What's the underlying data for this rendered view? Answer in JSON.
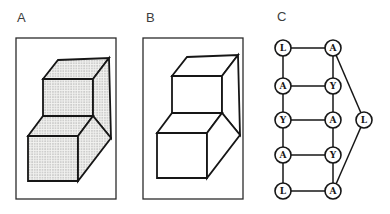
{
  "panels": {
    "a": {
      "label": "A",
      "label_pos": {
        "left": 17,
        "top": 11
      },
      "frame": {
        "x": 16,
        "y": 38,
        "w": 100,
        "h": 161
      },
      "shaded": true
    },
    "b": {
      "label": "B",
      "label_pos": {
        "left": 146,
        "top": 11
      },
      "frame": {
        "x": 143,
        "y": 38,
        "w": 100,
        "h": 161
      },
      "shaded": false
    },
    "c": {
      "label": "C",
      "label_pos": {
        "left": 277,
        "top": 10
      }
    }
  },
  "staircase": {
    "vertices": {
      "p1": [
        187,
        57
      ],
      "p2": [
        238,
        55
      ],
      "p3": [
        172,
        76
      ],
      "p4": [
        222,
        76
      ],
      "p5": [
        172,
        113
      ],
      "p6": [
        222,
        113
      ],
      "p7": [
        157,
        133
      ],
      "p8": [
        207,
        133
      ],
      "p9": [
        157,
        178
      ],
      "p10": [
        207,
        178
      ],
      "p11": [
        240,
        135
      ]
    },
    "faces": [
      {
        "name": "top-face",
        "points": [
          "p3",
          "p1",
          "p2",
          "p4"
        ]
      },
      {
        "name": "upper-front-face",
        "points": [
          "p3",
          "p4",
          "p6",
          "p5"
        ]
      },
      {
        "name": "upper-right-face",
        "points": [
          "p4",
          "p2",
          "p11",
          "p6"
        ]
      },
      {
        "name": "step-tread-face",
        "points": [
          "p7",
          "p5",
          "p6",
          "p8"
        ]
      },
      {
        "name": "lower-front-face",
        "points": [
          "p7",
          "p8",
          "p10",
          "p9"
        ]
      },
      {
        "name": "lower-right-face",
        "points": [
          "p8",
          "p6",
          "p11",
          "p10"
        ]
      }
    ],
    "panel_a_offset": [
      -129,
      3
    ],
    "panel_b_offset": [
      0,
      0
    ]
  },
  "graph": {
    "node_radius": 8,
    "nodes": [
      {
        "id": "l1",
        "x": 283,
        "y": 48,
        "label": "L"
      },
      {
        "id": "l2",
        "x": 283,
        "y": 86,
        "label": "A"
      },
      {
        "id": "l3",
        "x": 283,
        "y": 120,
        "label": "Y"
      },
      {
        "id": "l4",
        "x": 283,
        "y": 155,
        "label": "A"
      },
      {
        "id": "l5",
        "x": 283,
        "y": 191,
        "label": "L"
      },
      {
        "id": "r1",
        "x": 333,
        "y": 48,
        "label": "A"
      },
      {
        "id": "r2",
        "x": 333,
        "y": 86,
        "label": "Y"
      },
      {
        "id": "r3",
        "x": 333,
        "y": 120,
        "label": "A"
      },
      {
        "id": "r4",
        "x": 333,
        "y": 155,
        "label": "Y"
      },
      {
        "id": "r5",
        "x": 333,
        "y": 191,
        "label": "A"
      },
      {
        "id": "f1",
        "x": 364,
        "y": 120,
        "label": "L"
      }
    ],
    "edges": [
      [
        "l1",
        "r1"
      ],
      [
        "l2",
        "r2"
      ],
      [
        "l3",
        "r3"
      ],
      [
        "l4",
        "r4"
      ],
      [
        "l5",
        "r5"
      ],
      [
        "l1",
        "l2"
      ],
      [
        "l2",
        "l3"
      ],
      [
        "l3",
        "l4"
      ],
      [
        "l4",
        "l5"
      ],
      [
        "r1",
        "r2"
      ],
      [
        "r2",
        "r3"
      ],
      [
        "r3",
        "r4"
      ],
      [
        "r4",
        "r5"
      ],
      [
        "r1",
        "f1"
      ],
      [
        "r5",
        "f1"
      ]
    ]
  },
  "colors": {
    "line": "#161616",
    "frame": "#2b2b2b",
    "plain_fill": "#ffffff",
    "stipple_dot": "#a4a4a4",
    "stipple_bg": "#f2f2f0",
    "label": "#3d3d3d"
  }
}
